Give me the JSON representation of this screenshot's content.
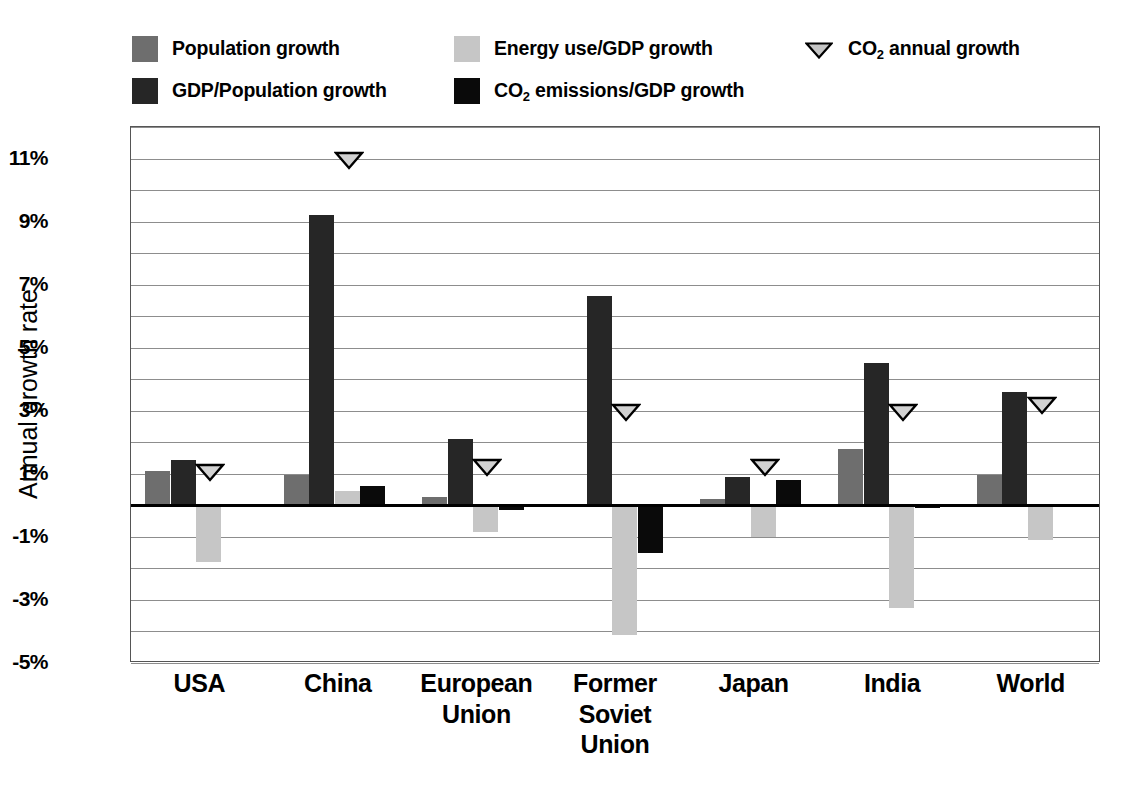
{
  "chart_data": {
    "type": "bar",
    "title": "",
    "xlabel": "",
    "ylabel": "Annual growth rate",
    "ylim": [
      -5,
      12
    ],
    "ytick_values": [
      11,
      9,
      7,
      5,
      3,
      1,
      -1,
      -3,
      -5
    ],
    "ytick_labels": [
      "11%",
      "9%",
      "7%",
      "5%",
      "3%",
      "1%",
      "-1%",
      "-3%",
      "-5%"
    ],
    "gridlines": [
      12,
      11,
      10,
      9,
      8,
      7,
      6,
      5,
      4,
      3,
      2,
      1,
      -1,
      -2,
      -3,
      -4,
      -5
    ],
    "grid": true,
    "legend_position": "top",
    "categories": [
      "USA",
      "China",
      "European Union",
      "Former Soviet Union",
      "Japan",
      "India",
      "World"
    ],
    "series": [
      {
        "name": "Population growth",
        "color": "#6e6e6e",
        "values": [
          1.1,
          0.95,
          0.25,
          0.0,
          0.2,
          1.8,
          0.95
        ]
      },
      {
        "name": "GDP/Population growth",
        "color": "#262626",
        "values": [
          1.45,
          9.2,
          2.1,
          6.65,
          0.9,
          4.5,
          3.6
        ]
      },
      {
        "name": "Energy use/GDP growth",
        "color": "#c6c6c6",
        "values": [
          -1.8,
          0.45,
          -0.85,
          -4.1,
          -1.0,
          -3.25,
          -1.1
        ]
      },
      {
        "name": "CO2 emissions/GDP growth",
        "color": "#0a0a0a",
        "values": [
          0.0,
          0.6,
          -0.15,
          -1.5,
          0.8,
          -0.1,
          0.0
        ]
      }
    ],
    "marker_series": {
      "name": "CO2 annual growth",
      "values": [
        1.1,
        11.0,
        1.25,
        3.0,
        1.25,
        3.0,
        3.2
      ]
    }
  },
  "legend": {
    "items": [
      {
        "id": "population-growth",
        "label": "Population growth",
        "sub": "",
        "label_tail": "",
        "type": "swatch",
        "color": "#6e6e6e"
      },
      {
        "id": "gdp-population-growth",
        "label": "GDP/Population growth",
        "sub": "",
        "label_tail": "",
        "type": "swatch",
        "color": "#262626"
      },
      {
        "id": "energy-use-gdp-growth",
        "label": "Energy use/GDP growth",
        "sub": "",
        "label_tail": "",
        "type": "swatch",
        "color": "#c6c6c6"
      },
      {
        "id": "co2-emissions-gdp-growth",
        "label": "CO",
        "sub": "2",
        "label_tail": " emissions/GDP growth",
        "type": "swatch",
        "color": "#0a0a0a"
      },
      {
        "id": "co2-annual-growth",
        "label": "CO",
        "sub": "2",
        "label_tail": " annual growth",
        "type": "marker",
        "color": "#c6c6c6"
      }
    ]
  },
  "axis": {
    "y_title": "Annual growth rate"
  }
}
